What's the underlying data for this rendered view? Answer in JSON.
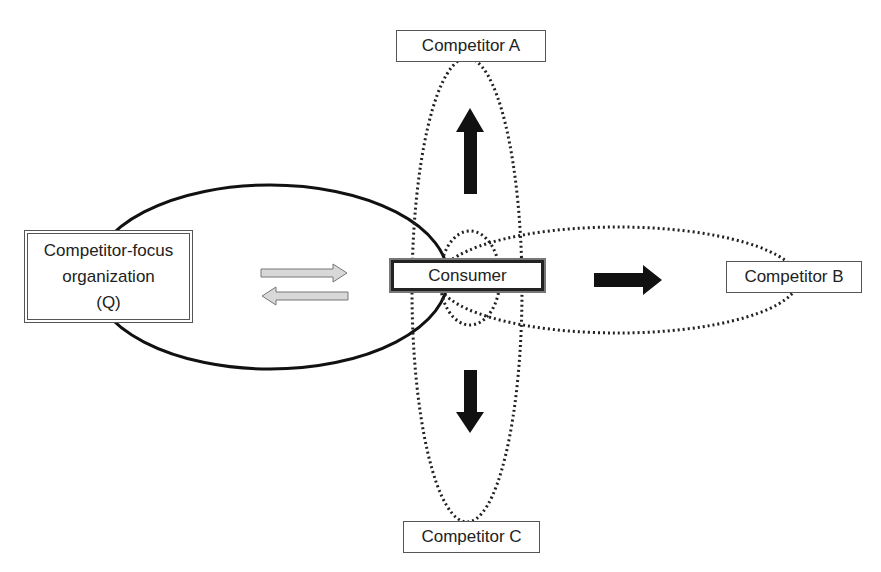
{
  "nodes": {
    "focus_org": {
      "line1": "Competitor-focus",
      "line2": "organization",
      "line3": "(Q)"
    },
    "consumer": {
      "label": "Consumer"
    },
    "competitor_a": {
      "label": "Competitor A"
    },
    "competitor_b": {
      "label": "Competitor B"
    },
    "competitor_c": {
      "label": "Competitor C"
    }
  },
  "arrows": [
    {
      "from": "focus_org",
      "to": "consumer",
      "style": "gray-outline"
    },
    {
      "from": "consumer",
      "to": "focus_org",
      "style": "gray-outline"
    },
    {
      "direction": "up",
      "toward": "competitor_a",
      "style": "solid-black"
    },
    {
      "direction": "right",
      "toward": "competitor_b",
      "style": "solid-black"
    },
    {
      "direction": "down",
      "toward": "competitor_c",
      "style": "solid-black"
    }
  ],
  "colors": {
    "solid_ellipse": "#111111",
    "dotted_ellipse": "#222222",
    "gray_arrow_fill": "#d8d8d8",
    "black_arrow": "#111111"
  }
}
